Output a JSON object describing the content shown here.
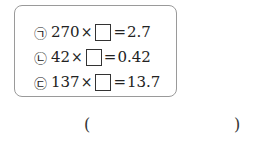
{
  "problem": {
    "options": [
      {
        "marker": "㉠",
        "left": "270",
        "op": "×",
        "eq": "=",
        "right": "2.7"
      },
      {
        "marker": "㉡",
        "left": "42",
        "op": "×",
        "eq": "=",
        "right": "0.42"
      },
      {
        "marker": "㉢",
        "left": "137",
        "op": "×",
        "eq": "=",
        "right": "13.7"
      }
    ],
    "answer": {
      "open": "(",
      "close": ")",
      "value": ""
    }
  }
}
